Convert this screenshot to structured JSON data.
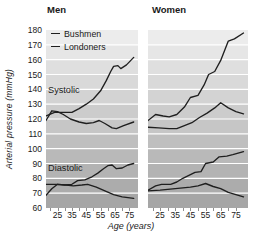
{
  "figure": {
    "panel_titles": {
      "left": "Men",
      "right": "Women"
    },
    "y_axis": {
      "label": "Arterial pressure (mmHg)",
      "ticks": [
        180,
        170,
        160,
        150,
        140,
        130,
        120,
        110,
        100,
        90,
        80,
        70,
        60
      ]
    },
    "x_axis": {
      "label": "Age (years)",
      "tick_labels": [
        25,
        35,
        45,
        55,
        65,
        75
      ],
      "minor_ticks": [
        20,
        25,
        30,
        35,
        40,
        45,
        50,
        55,
        60,
        65,
        70,
        75
      ]
    },
    "legend": {
      "items": [
        {
          "label": "Bushmen"
        },
        {
          "label": "Londoners"
        }
      ]
    },
    "annotations": {
      "systolic": "Systolic",
      "diastolic": "Diastolic"
    }
  },
  "colors": {
    "line": "#1f1f1f",
    "band_top": "#ececec",
    "band_bottom": "#a6a6a6",
    "gridline": "#ffffff",
    "text": "#1a1a1a",
    "tick": "#8f8f8f"
  },
  "chart_data": [
    {
      "type": "line",
      "title": "Men",
      "xlabel": "Age (years)",
      "ylabel": "Arterial pressure (mmHg)",
      "xlim": [
        17,
        81
      ],
      "ylim": [
        60,
        180
      ],
      "grid": "horizontal-bands-every-10",
      "legend_position": "top-left",
      "series": [
        {
          "name": "Londoners systolic",
          "points": [
            [
              17,
              122
            ],
            [
              23,
              124.5
            ],
            [
              29,
              124.5
            ],
            [
              35,
              124.5
            ],
            [
              40,
              127
            ],
            [
              45,
              130
            ],
            [
              50,
              133.5
            ],
            [
              55,
              139
            ],
            [
              59,
              146
            ],
            [
              62,
              152
            ],
            [
              64,
              155.5
            ],
            [
              67,
              156
            ],
            [
              69,
              154
            ],
            [
              73,
              156.5
            ],
            [
              78,
              161.5
            ]
          ]
        },
        {
          "name": "Bushmen systolic",
          "points": [
            [
              17,
              119
            ],
            [
              21,
              125.5
            ],
            [
              25,
              125
            ],
            [
              29,
              123
            ],
            [
              34,
              120
            ],
            [
              40,
              118
            ],
            [
              45,
              117
            ],
            [
              50,
              117.5
            ],
            [
              54,
              119
            ],
            [
              58,
              117
            ],
            [
              63,
              114
            ],
            [
              66,
              113.5
            ],
            [
              71,
              115.5
            ],
            [
              78,
              118
            ]
          ]
        },
        {
          "name": "Londoners diastolic",
          "points": [
            [
              17,
              68.5
            ],
            [
              21,
              73
            ],
            [
              25,
              76
            ],
            [
              30,
              75.5
            ],
            [
              35,
              76
            ],
            [
              39,
              78.5
            ],
            [
              44,
              79
            ],
            [
              49,
              81
            ],
            [
              53,
              83.5
            ],
            [
              57,
              86.5
            ],
            [
              60,
              88.5
            ],
            [
              63,
              89
            ],
            [
              66,
              86.5
            ],
            [
              70,
              87
            ],
            [
              74,
              89
            ],
            [
              78,
              90
            ]
          ]
        },
        {
          "name": "Bushmen diastolic",
          "points": [
            [
              17,
              76
            ],
            [
              25,
              76
            ],
            [
              31,
              75.5
            ],
            [
              36,
              75
            ],
            [
              42,
              75.5
            ],
            [
              46,
              76
            ],
            [
              52,
              74
            ],
            [
              58,
              71.5
            ],
            [
              64,
              69
            ],
            [
              70,
              67.5
            ],
            [
              78,
              66.5
            ]
          ]
        }
      ]
    },
    {
      "type": "line",
      "title": "Women",
      "xlabel": "Age (years)",
      "ylabel": "Arterial pressure (mmHg)",
      "xlim": [
        17,
        83
      ],
      "ylim": [
        60,
        180
      ],
      "grid": "horizontal-bands-every-10",
      "legend_position": "none",
      "series": [
        {
          "name": "Londoners systolic",
          "points": [
            [
              17,
              119
            ],
            [
              22,
              123
            ],
            [
              27,
              122
            ],
            [
              31,
              121.5
            ],
            [
              36,
              123
            ],
            [
              41,
              128
            ],
            [
              45,
              134.5
            ],
            [
              50,
              136
            ],
            [
              54,
              143
            ],
            [
              57,
              150
            ],
            [
              61,
              152
            ],
            [
              65,
              159.5
            ],
            [
              70,
              172.5
            ],
            [
              74,
              174
            ],
            [
              80,
              178
            ]
          ]
        },
        {
          "name": "Bushmen systolic",
          "points": [
            [
              17,
              114.5
            ],
            [
              24,
              114
            ],
            [
              31,
              113.5
            ],
            [
              36,
              113.5
            ],
            [
              41,
              115.5
            ],
            [
              46,
              117.5
            ],
            [
              51,
              121
            ],
            [
              56,
              124
            ],
            [
              61,
              127.5
            ],
            [
              65,
              131
            ],
            [
              70,
              127.5
            ],
            [
              75,
              125
            ],
            [
              80,
              123.5
            ]
          ]
        },
        {
          "name": "Londoners diastolic",
          "points": [
            [
              17,
              72
            ],
            [
              22,
              75
            ],
            [
              26,
              76
            ],
            [
              32,
              76
            ],
            [
              36,
              77.5
            ],
            [
              40,
              80
            ],
            [
              44,
              82
            ],
            [
              48,
              84
            ],
            [
              52,
              84.5
            ],
            [
              55,
              90
            ],
            [
              60,
              91
            ],
            [
              64,
              94.5
            ],
            [
              69,
              95
            ],
            [
              73,
              96
            ],
            [
              80,
              98
            ]
          ]
        },
        {
          "name": "Bushmen diastolic",
          "points": [
            [
              17,
              71.5
            ],
            [
              25,
              72
            ],
            [
              35,
              73
            ],
            [
              45,
              74
            ],
            [
              50,
              75
            ],
            [
              55,
              76.5
            ],
            [
              60,
              74.5
            ],
            [
              65,
              73
            ],
            [
              70,
              70.5
            ],
            [
              75,
              69
            ],
            [
              80,
              67.5
            ]
          ]
        }
      ]
    }
  ]
}
